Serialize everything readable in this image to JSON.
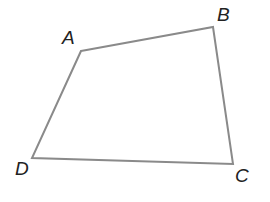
{
  "diagram": {
    "type": "quadrilateral",
    "stroke_color": "#8a8a8a",
    "label_color": "#222222",
    "vertices": [
      {
        "name": "A",
        "x": 81,
        "y": 51,
        "label_x": 62,
        "label_y": 44
      },
      {
        "name": "B",
        "x": 213,
        "y": 27,
        "label_x": 217,
        "label_y": 21
      },
      {
        "name": "C",
        "x": 233,
        "y": 164,
        "label_x": 235,
        "label_y": 182
      },
      {
        "name": "D",
        "x": 32,
        "y": 158,
        "label_x": 15,
        "label_y": 175
      }
    ],
    "edges": [
      [
        "A",
        "B"
      ],
      [
        "B",
        "C"
      ],
      [
        "C",
        "D"
      ],
      [
        "D",
        "A"
      ]
    ]
  }
}
